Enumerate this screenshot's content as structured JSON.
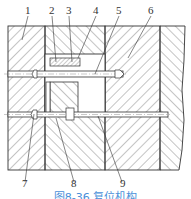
{
  "figure": {
    "caption": "图8-36  复位机构",
    "caption_color": "#4a90d9",
    "line_color": "#333333",
    "top_labels": [
      "1",
      "2",
      "3",
      "4",
      "5",
      "6"
    ],
    "bottom_labels": [
      "7",
      "8",
      "9"
    ]
  }
}
